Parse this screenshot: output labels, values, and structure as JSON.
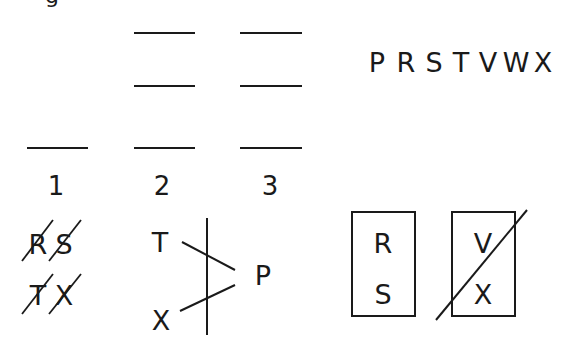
{
  "diagram": {
    "top_fragment": "g",
    "letter_pool": {
      "letters": [
        "P",
        "R",
        "S",
        "T",
        "V",
        "W",
        "X"
      ]
    },
    "slots": [
      {
        "label": "1",
        "blank_count": 1
      },
      {
        "label": "2",
        "blank_count": 3
      },
      {
        "label": "3",
        "blank_count": 3
      }
    ],
    "crossed_pairs": {
      "rows": [
        {
          "letters": [
            "R",
            "S"
          ],
          "crossed": [
            true,
            true
          ]
        },
        {
          "letters": [
            "T",
            "X"
          ],
          "crossed": [
            true,
            true
          ]
        }
      ]
    },
    "branch": {
      "left_top": "T",
      "left_bottom": "X",
      "right": "P"
    },
    "boxes": [
      {
        "letters": [
          "R",
          "S"
        ],
        "crossed_out": false
      },
      {
        "letters": [
          "V",
          "X"
        ],
        "crossed_out": true
      }
    ]
  },
  "colors": {
    "ink": "#1a1a1a",
    "background": "#ffffff"
  }
}
